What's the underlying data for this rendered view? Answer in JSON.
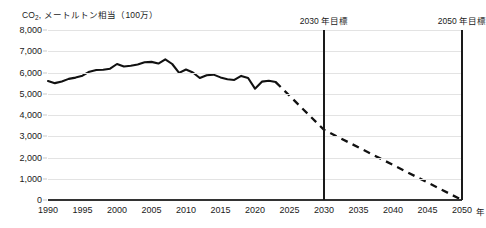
{
  "chart_data": {
    "type": "line",
    "title": "CO2, メートルトン相当（100万）",
    "title_prefix": "CO",
    "title_sub": "2",
    "title_rest": ", メートルトン相当（100万）",
    "xlabel": "年",
    "ylabel": "CO2, メートルトン相当（100万）",
    "xlim": [
      1990,
      2050
    ],
    "ylim": [
      0,
      8000
    ],
    "grid": true,
    "legend": "none",
    "yticks": [
      "8,000",
      "7,000",
      "6,000",
      "5,000",
      "4,000",
      "3,000",
      "2,000",
      "1,000",
      "0"
    ],
    "ytick_values": [
      8000,
      7000,
      6000,
      5000,
      4000,
      3000,
      2000,
      1000,
      0
    ],
    "xticks": [
      "1990",
      "1995",
      "2000",
      "2005",
      "2010",
      "2015",
      "2020",
      "2025",
      "2030",
      "2035",
      "2040",
      "2045",
      "2050"
    ],
    "xtick_values": [
      1990,
      1995,
      2000,
      2005,
      2010,
      2015,
      2020,
      2025,
      2030,
      2035,
      2040,
      2045,
      2050
    ],
    "x_unit_label": "年",
    "series": [
      {
        "name": "historical",
        "style": "solid",
        "color": "#111111",
        "x": [
          1990,
          1991,
          1992,
          1993,
          1994,
          1995,
          1996,
          1997,
          1998,
          1999,
          2000,
          2001,
          2002,
          2003,
          2004,
          2005,
          2006,
          2007,
          2008,
          2009,
          2010,
          2011,
          2012,
          2013,
          2014,
          2015,
          2016,
          2017,
          2018,
          2019,
          2020,
          2021,
          2022,
          2023
        ],
        "values": [
          5600,
          5500,
          5580,
          5700,
          5760,
          5850,
          6040,
          6120,
          6130,
          6180,
          6400,
          6280,
          6320,
          6380,
          6480,
          6500,
          6420,
          6620,
          6400,
          5980,
          6140,
          6000,
          5740,
          5870,
          5900,
          5770,
          5680,
          5650,
          5840,
          5740,
          5240,
          5570,
          5610,
          5550
        ]
      },
      {
        "name": "projection",
        "style": "dashed",
        "color": "#111111",
        "x": [
          2023,
          2030,
          2050
        ],
        "values": [
          5550,
          3300,
          0
        ]
      }
    ],
    "annotations": [
      {
        "name": "2030-target",
        "x": 2030,
        "label": "2030 年目標"
      },
      {
        "name": "2050-target",
        "x": 2050,
        "label": "2050 年目標"
      }
    ],
    "colors": {
      "line": "#111111",
      "grid": "#e3e3e3",
      "axis": "#333333",
      "target": "#1a1a1a",
      "text": "#1a1a1a",
      "background": "#ffffff"
    }
  }
}
